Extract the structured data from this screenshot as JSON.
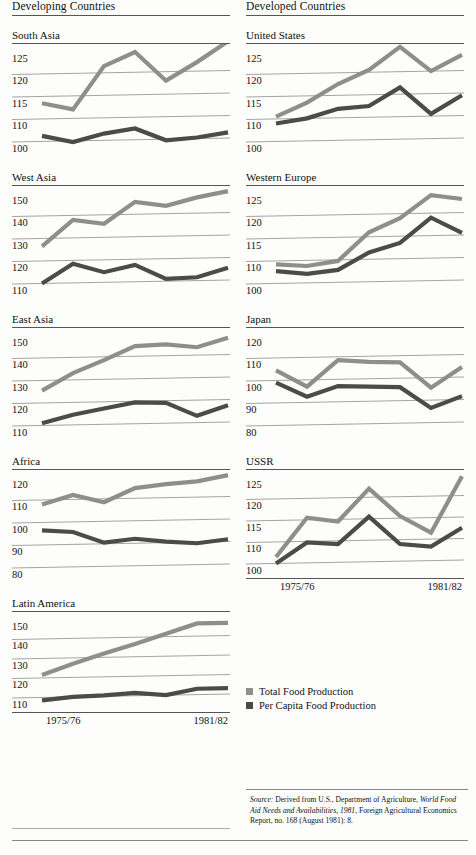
{
  "columns": {
    "left_title": "Developing Countries",
    "right_title": "Developed Countries"
  },
  "xaxis": {
    "start_label": "1975/76",
    "end_label": "1981/82"
  },
  "legend": [
    {
      "label": "Total Food Production",
      "color": "#8e8e8e"
    },
    {
      "label": "Per Capita Food Production",
      "color": "#4b4b4b"
    }
  ],
  "source": {
    "prefix": "Source:",
    "text1": " Derived from U.S., Department of Agriculture, ",
    "italic1": "World Food Aid Needs and Availabilities, 1981",
    "text2": ", Foreign Agricultural Economics Report, no. 168 (August 1981): 8."
  },
  "chart_data": [
    {
      "type": "line",
      "title": "South Asia",
      "panel": "left-1",
      "xlabel": "",
      "ylabel": "",
      "x": [
        "1975/76",
        "1976/77",
        "1977/78",
        "1978/79",
        "1979/80",
        "1980/81",
        "1981/82"
      ],
      "tick_labels": [
        "125",
        "120",
        "115",
        "110",
        "100"
      ],
      "tick_values": [
        125,
        120,
        115,
        110,
        100
      ],
      "ylim": [
        97,
        128
      ],
      "grid": true,
      "series": [
        {
          "name": "Total Food Production",
          "color": "#8e8e8e",
          "values": [
            113.5,
            112.0,
            121.5,
            124.5,
            118.0,
            122.0,
            126.5
          ]
        },
        {
          "name": "Per Capita Food Production",
          "color": "#4b4b4b",
          "values": [
            102.5,
            99.5,
            103.0,
            105.0,
            99.5,
            100.5,
            102.5
          ]
        }
      ]
    },
    {
      "type": "line",
      "title": "West Asia",
      "panel": "left-2",
      "x": [
        "1975/76",
        "1976/77",
        "1977/78",
        "1978/79",
        "1979/80",
        "1980/81",
        "1981/82"
      ],
      "tick_labels": [
        "150",
        "140",
        "130",
        "120",
        "110"
      ],
      "tick_values": [
        150,
        140,
        130,
        120,
        110
      ],
      "ylim": [
        105,
        154
      ],
      "grid": true,
      "series": [
        {
          "name": "Total Food Production",
          "color": "#8e8e8e",
          "values": [
            126.5,
            138.0,
            136.0,
            145.5,
            143.5,
            147.0,
            149.5
          ]
        },
        {
          "name": "Per Capita Food Production",
          "color": "#4b4b4b",
          "values": [
            110.0,
            118.5,
            114.5,
            117.5,
            111.0,
            111.5,
            115.5
          ]
        }
      ]
    },
    {
      "type": "line",
      "title": "East Asia",
      "panel": "left-3",
      "x": [
        "1975/76",
        "1976/77",
        "1977/78",
        "1978/79",
        "1979/80",
        "1980/81",
        "1981/82"
      ],
      "tick_labels": [
        "150",
        "140",
        "130",
        "120",
        "110"
      ],
      "tick_values": [
        150,
        140,
        130,
        120,
        110
      ],
      "ylim": [
        105,
        154
      ],
      "grid": true,
      "series": [
        {
          "name": "Total Food Production",
          "color": "#8e8e8e",
          "values": [
            125.5,
            133.0,
            138.5,
            144.5,
            145.0,
            143.5,
            147.5
          ]
        },
        {
          "name": "Per Capita Food Production",
          "color": "#4b4b4b",
          "values": [
            111.0,
            114.5,
            117.0,
            119.5,
            119.0,
            113.0,
            117.5
          ]
        }
      ]
    },
    {
      "type": "line",
      "title": "Africa",
      "panel": "left-4",
      "x": [
        "1975/76",
        "1976/77",
        "1977/78",
        "1978/79",
        "1979/80",
        "1980/81",
        "1981/82"
      ],
      "tick_labels": [
        "120",
        "110",
        "100",
        "90",
        "80"
      ],
      "tick_values": [
        120,
        110,
        100,
        90,
        80
      ],
      "ylim": [
        76,
        124
      ],
      "grid": true,
      "series": [
        {
          "name": "Total Food Production",
          "color": "#8e8e8e",
          "values": [
            108.0,
            112.0,
            108.5,
            114.5,
            116.0,
            117.0,
            119.5
          ]
        },
        {
          "name": "Per Capita Food Production",
          "color": "#4b4b4b",
          "values": [
            96.5,
            95.5,
            90.5,
            92.0,
            90.5,
            89.5,
            91.0
          ]
        }
      ]
    },
    {
      "type": "line",
      "title": "Latin America",
      "panel": "left-5",
      "x": [
        "1975/76",
        "1976/77",
        "1977/78",
        "1978/79",
        "1979/80",
        "1980/81",
        "1981/82"
      ],
      "tick_labels": [
        "150",
        "140",
        "130",
        "120",
        "110"
      ],
      "tick_values": [
        150,
        140,
        130,
        120,
        110
      ],
      "ylim": [
        104,
        154
      ],
      "grid": true,
      "series": [
        {
          "name": "Total Food Production",
          "color": "#8e8e8e",
          "values": [
            121.5,
            127.0,
            132.0,
            136.5,
            141.5,
            146.5,
            146.5
          ]
        },
        {
          "name": "Per Capita Food Production",
          "color": "#4b4b4b",
          "values": [
            108.5,
            110.0,
            110.5,
            111.5,
            110.0,
            113.0,
            113.0
          ]
        }
      ]
    },
    {
      "type": "line",
      "title": "United States",
      "panel": "right-1",
      "x": [
        "1975/76",
        "1976/77",
        "1977/78",
        "1978/79",
        "1979/80",
        "1980/81",
        "1981/82"
      ],
      "tick_labels": [
        "125",
        "120",
        "115",
        "110",
        "100"
      ],
      "tick_values": [
        125,
        120,
        115,
        110,
        100
      ],
      "ylim": [
        97,
        128
      ],
      "grid": true,
      "series": [
        {
          "name": "Total Food Production",
          "color": "#8e8e8e",
          "values": [
            110.5,
            113.5,
            117.5,
            120.5,
            125.5,
            120.0,
            123.5
          ]
        },
        {
          "name": "Per Capita Food Production",
          "color": "#4b4b4b",
          "values": [
            108.0,
            110.0,
            112.0,
            112.5,
            116.5,
            110.5,
            114.5
          ]
        }
      ]
    },
    {
      "type": "line",
      "title": "Western Europe",
      "panel": "right-2",
      "x": [
        "1975/76",
        "1976/77",
        "1977/78",
        "1978/79",
        "1979/80",
        "1980/81",
        "1981/82"
      ],
      "tick_labels": [
        "125",
        "120",
        "115",
        "110",
        "100"
      ],
      "tick_values": [
        125,
        120,
        115,
        110,
        100
      ],
      "ylim": [
        97,
        128
      ],
      "grid": true,
      "series": [
        {
          "name": "Total Food Production",
          "color": "#8e8e8e",
          "values": [
            108.5,
            107.5,
            109.5,
            116.0,
            119.0,
            124.0,
            123.0
          ]
        },
        {
          "name": "Per Capita Food Production",
          "color": "#4b4b4b",
          "values": [
            105.5,
            104.0,
            105.5,
            111.5,
            113.5,
            119.0,
            115.5
          ]
        }
      ]
    },
    {
      "type": "line",
      "title": "Japan",
      "panel": "right-3",
      "x": [
        "1975/76",
        "1976/77",
        "1977/78",
        "1978/79",
        "1979/80",
        "1980/81",
        "1981/82"
      ],
      "tick_labels": [
        "120",
        "110",
        "100",
        "90",
        "80"
      ],
      "tick_values": [
        120,
        110,
        100,
        90,
        80
      ],
      "ylim": [
        76,
        124
      ],
      "grid": true,
      "series": [
        {
          "name": "Total Food Production",
          "color": "#8e8e8e",
          "values": [
            104.5,
            97.0,
            108.5,
            107.5,
            107.0,
            95.5,
            104.5
          ]
        },
        {
          "name": "Per Capita Food Production",
          "color": "#4b4b4b",
          "values": [
            99.0,
            92.5,
            97.0,
            96.5,
            96.0,
            86.5,
            91.5
          ]
        }
      ]
    },
    {
      "type": "line",
      "title": "USSR",
      "panel": "right-4",
      "x": [
        "1975/76",
        "1976/77",
        "1977/78",
        "1978/79",
        "1979/80",
        "1980/81",
        "1981/82"
      ],
      "tick_labels": [
        "125",
        "120",
        "115",
        "110",
        "100"
      ],
      "tick_values": [
        125,
        120,
        115,
        110,
        100
      ],
      "ylim": [
        97,
        128
      ],
      "grid": true,
      "series": [
        {
          "name": "Total Food Production",
          "color": "#8e8e8e",
          "values": [
            103.0,
            115.5,
            114.5,
            122.0,
            115.5,
            111.5,
            124.5
          ]
        },
        {
          "name": "Per Capita Food Production",
          "color": "#4b4b4b",
          "values": [
            100.0,
            109.5,
            108.5,
            115.5,
            108.0,
            106.5,
            112.5
          ]
        }
      ]
    }
  ]
}
